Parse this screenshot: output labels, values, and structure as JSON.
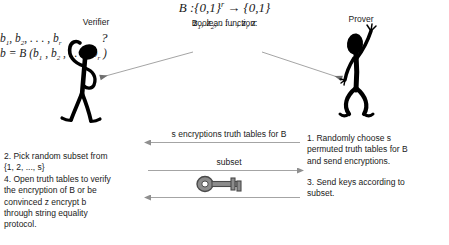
{
  "diagram": {
    "title": "Boolean function:",
    "formula_main": "B :{0,1}",
    "formula_exp": "r",
    "formula_arrow": " → {0,1}",
    "formula_sub": "z1, z2, . . . , zr z",
    "verifier_label": "Verifier",
    "prover_label": "Prover",
    "thinking_glyph": "?",
    "prover_line1": "b1, b2, . . . , br",
    "prover_line2": "b = B (b1 , b2 , . . . , br )",
    "messages": {
      "encryptions": "s encryptions truth tables for B",
      "subset": "subset",
      "keys_icon": "key-icon"
    },
    "verifier_steps": [
      "2. Pick random subset from",
      "{1, 2, ..., s}",
      "4. Open truth tables to verify",
      "the encryption of B or be",
      "convinced z encrypt b",
      "through string equality",
      "protocol."
    ],
    "prover_steps_1": [
      "1. Randomly choose s",
      "permuted truth tables for B",
      "and send encryptions."
    ],
    "prover_steps_2": [
      "3. Send keys according to",
      "subset."
    ],
    "colors": {
      "figure": "#000000",
      "text": "#1a1a1a",
      "arrow": "#9a9a9a",
      "key_fill": "#8c8c8c",
      "background": "#ffffff"
    }
  }
}
